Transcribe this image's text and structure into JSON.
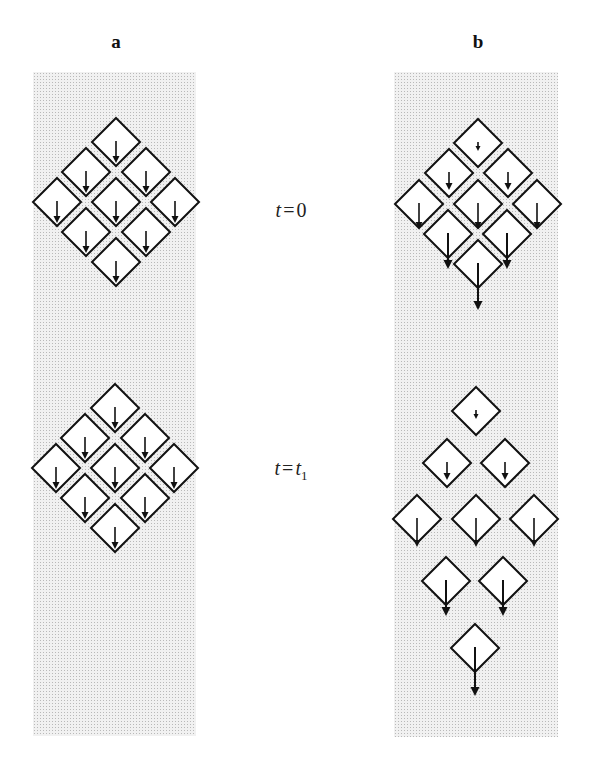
{
  "labels": {
    "panel_a": "a",
    "panel_b": "b"
  },
  "time_labels": [
    {
      "id": "t0",
      "var": "t",
      "eq": "=",
      "rhs": "0",
      "sub": "",
      "x": 291,
      "y": 210
    },
    {
      "id": "t1",
      "var": "t",
      "eq": "=",
      "rhs": "t",
      "sub": "1",
      "x": 291,
      "y": 470
    }
  ],
  "colors": {
    "stroke": "#111111",
    "diamond_fill": "#ffffff",
    "panel_bg": "#f1f1f1"
  },
  "panels": [
    {
      "id": "a",
      "x": 33,
      "y": 72,
      "w": 163,
      "h": 664
    },
    {
      "id": "b",
      "x": 394,
      "y": 72,
      "w": 164,
      "h": 665
    }
  ],
  "diamond_half": 24,
  "groups": [
    {
      "name": "panel-a-t0",
      "diamonds": [
        {
          "cx": 116,
          "cy": 142,
          "len": 22
        },
        {
          "cx": 86,
          "cy": 172,
          "len": 22
        },
        {
          "cx": 146,
          "cy": 172,
          "len": 22
        },
        {
          "cx": 57,
          "cy": 202,
          "len": 22
        },
        {
          "cx": 116,
          "cy": 202,
          "len": 22
        },
        {
          "cx": 175,
          "cy": 202,
          "len": 22
        },
        {
          "cx": 86,
          "cy": 232,
          "len": 22
        },
        {
          "cx": 146,
          "cy": 232,
          "len": 22
        },
        {
          "cx": 116,
          "cy": 262,
          "len": 22
        }
      ]
    },
    {
      "name": "panel-a-t1",
      "diamonds": [
        {
          "cx": 115,
          "cy": 408,
          "len": 22
        },
        {
          "cx": 85,
          "cy": 438,
          "len": 22
        },
        {
          "cx": 145,
          "cy": 438,
          "len": 22
        },
        {
          "cx": 56,
          "cy": 468,
          "len": 22
        },
        {
          "cx": 115,
          "cy": 468,
          "len": 22
        },
        {
          "cx": 174,
          "cy": 468,
          "len": 22
        },
        {
          "cx": 85,
          "cy": 498,
          "len": 22
        },
        {
          "cx": 145,
          "cy": 498,
          "len": 22
        },
        {
          "cx": 115,
          "cy": 528,
          "len": 22
        }
      ]
    },
    {
      "name": "panel-b-t0",
      "diamonds": [
        {
          "cx": 478,
          "cy": 143,
          "len": 9
        },
        {
          "cx": 449,
          "cy": 173,
          "len": 18
        },
        {
          "cx": 508,
          "cy": 173,
          "len": 18
        },
        {
          "cx": 419,
          "cy": 204,
          "len": 26
        },
        {
          "cx": 478,
          "cy": 204,
          "len": 26
        },
        {
          "cx": 537,
          "cy": 204,
          "len": 26
        },
        {
          "cx": 448,
          "cy": 234,
          "len": 36
        },
        {
          "cx": 507,
          "cy": 234,
          "len": 36
        },
        {
          "cx": 478,
          "cy": 264,
          "len": 47
        }
      ]
    },
    {
      "name": "panel-b-t1",
      "diamonds": [
        {
          "cx": 476,
          "cy": 411,
          "len": 9
        },
        {
          "cx": 447,
          "cy": 463,
          "len": 18
        },
        {
          "cx": 505,
          "cy": 463,
          "len": 18
        },
        {
          "cx": 417,
          "cy": 519,
          "len": 29
        },
        {
          "cx": 476,
          "cy": 519,
          "len": 29
        },
        {
          "cx": 534,
          "cy": 519,
          "len": 29
        },
        {
          "cx": 446,
          "cy": 581,
          "len": 36
        },
        {
          "cx": 503,
          "cy": 581,
          "len": 36
        },
        {
          "cx": 475,
          "cy": 648,
          "len": 49
        }
      ]
    }
  ]
}
